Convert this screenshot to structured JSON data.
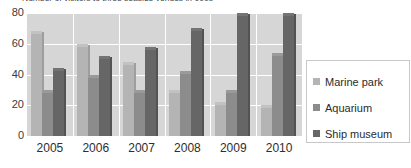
{
  "chart_data": {
    "type": "bar",
    "title": "Number of visitors to three seaside venues in 000s",
    "xlabel": "",
    "ylabel": "",
    "ylim": [
      0,
      80
    ],
    "yticks": [
      0,
      20,
      40,
      60,
      80
    ],
    "grid": true,
    "legend_position": "right",
    "categories": [
      "2005",
      "2006",
      "2007",
      "2008",
      "2009",
      "2010"
    ],
    "series": [
      {
        "name": "Marine park",
        "color": "#b4b4b4",
        "values": [
          68,
          60,
          48,
          30,
          22,
          20
        ]
      },
      {
        "name": "Aquarium",
        "color": "#8c8c8c",
        "values": [
          30,
          40,
          30,
          42,
          30,
          54
        ]
      },
      {
        "name": "Ship museum",
        "color": "#666666",
        "values": [
          44,
          52,
          58,
          70,
          80,
          80
        ]
      }
    ]
  },
  "axis": {
    "yticks": [
      "80",
      "60",
      "40",
      "20",
      "0"
    ],
    "xticks": [
      "2005",
      "2006",
      "2007",
      "2008",
      "2009",
      "2010"
    ]
  },
  "legend": {
    "items": [
      {
        "label": "Marine park"
      },
      {
        "label": "Aquarium"
      },
      {
        "label": "Ship museum"
      }
    ]
  }
}
